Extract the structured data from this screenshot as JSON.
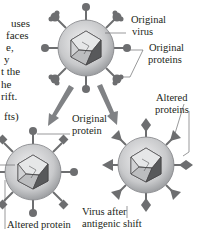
{
  "left_text_fragments": [
    "uses",
    "faces",
    "e,",
    "y",
    "t the",
    "he",
    "rift.",
    "fts)"
  ],
  "labels": {
    "original_virus": [
      "Original",
      "virus"
    ],
    "original_proteins": [
      "Original",
      "proteins"
    ],
    "original_protein": [
      "Original",
      "protein"
    ],
    "altered_proteins": [
      "Altered",
      "proteins"
    ],
    "altered_protein": "Altered protein",
    "virus_after_shift": [
      "Virus after",
      "antigenic shift"
    ]
  },
  "colors": {
    "text": "#231f20",
    "protein": "#6d6e70",
    "envelope": "#bcbdbf",
    "leader": "#6d6e70"
  }
}
